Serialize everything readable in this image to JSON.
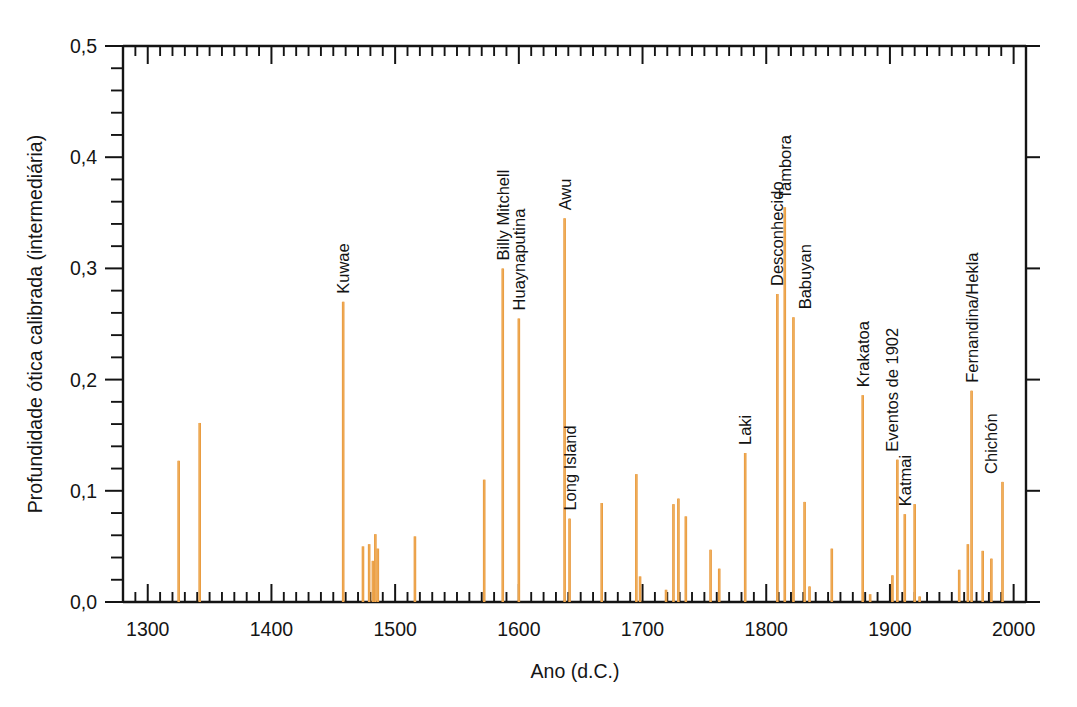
{
  "chart_data": {
    "type": "bar",
    "title": "",
    "subtitle": "",
    "xlabel": "Ano (d.C.)",
    "ylabel": "Profundidade ótica calibrada (intermediária)",
    "xlim": [
      1280,
      2010
    ],
    "ylim": [
      0.0,
      0.5
    ],
    "xticks": [
      1300,
      1400,
      1500,
      1600,
      1700,
      1800,
      1900,
      2000
    ],
    "xticklabels": [
      "1300",
      "1400",
      "1500",
      "1600",
      "1700",
      "1800",
      "1900",
      "2000"
    ],
    "x_minor_step": 10,
    "yticks": [
      0.0,
      0.1,
      0.2,
      0.3,
      0.4,
      0.5
    ],
    "yticklabels": [
      "0,0",
      "0,1",
      "0,2",
      "0,3",
      "0,4",
      "0,5"
    ],
    "y_minor_step": 0.02,
    "grid": false,
    "legend": null,
    "bar_color": "#e8983c",
    "axis_color": "#141414",
    "x": [
      1325,
      1342,
      1458,
      1474,
      1479,
      1482,
      1484,
      1486,
      1516,
      1572,
      1587,
      1600,
      1637,
      1641,
      1667,
      1695,
      1698,
      1719,
      1725,
      1729,
      1735,
      1755,
      1762,
      1783,
      1809,
      1815,
      1822,
      1831,
      1835,
      1853,
      1878,
      1884,
      1902,
      1906,
      1912,
      1920,
      1924,
      1956,
      1963,
      1966,
      1975,
      1982,
      1991
    ],
    "values": [
      0.127,
      0.161,
      0.27,
      0.05,
      0.052,
      0.037,
      0.061,
      0.048,
      0.059,
      0.11,
      0.3,
      0.255,
      0.345,
      0.075,
      0.089,
      0.115,
      0.023,
      0.011,
      0.088,
      0.093,
      0.077,
      0.047,
      0.03,
      0.134,
      0.277,
      0.355,
      0.256,
      0.09,
      0.014,
      0.048,
      0.186,
      0.007,
      0.024,
      0.128,
      0.079,
      0.088,
      0.005,
      0.029,
      0.052,
      0.19,
      0.046,
      0.039,
      0.108
    ],
    "annotations": [
      {
        "label": "Kuwae",
        "year": 1458,
        "value": 0.27
      },
      {
        "label": "Billy Mitchell",
        "year": 1587,
        "value": 0.3
      },
      {
        "label": "Huaynaputina",
        "year": 1600,
        "value": 0.255
      },
      {
        "label": "Awu",
        "year": 1637,
        "value": 0.345
      },
      {
        "label": "Long Island",
        "year": 1641,
        "value": 0.075
      },
      {
        "label": "Laki",
        "year": 1783,
        "value": 0.134
      },
      {
        "label": "Desconhecido",
        "year": 1809,
        "value": 0.277
      },
      {
        "label": "Tambora",
        "year": 1815,
        "value": 0.355
      },
      {
        "label": "Babuyan",
        "year": 1831,
        "value": 0.256
      },
      {
        "label": "Krakatoa",
        "year": 1878,
        "value": 0.186
      },
      {
        "label": "Eventos de 1902",
        "year": 1902,
        "value": 0.128
      },
      {
        "label": "Katmai",
        "year": 1912,
        "value": 0.079
      },
      {
        "label": "Fernandina/Hekla",
        "year": 1966,
        "value": 0.19
      },
      {
        "label": "Chichón",
        "year": 1982,
        "value": 0.108
      }
    ]
  }
}
